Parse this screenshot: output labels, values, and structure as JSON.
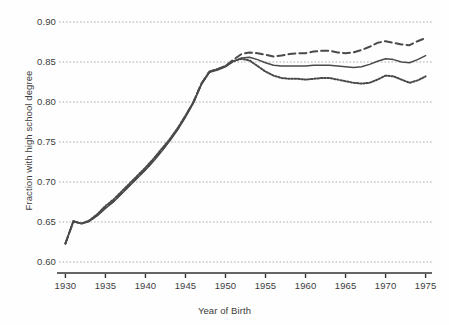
{
  "chart_data": {
    "type": "line",
    "title": "",
    "xlabel": "Year of Birth",
    "ylabel": "Fraction with high school degree",
    "xlim": [
      1929.2,
      1975.8
    ],
    "ylim": [
      0.6,
      0.9
    ],
    "xticks": [
      1930,
      1935,
      1940,
      1945,
      1950,
      1955,
      1960,
      1965,
      1970,
      1975
    ],
    "xtick_labels": [
      "1930",
      "1935",
      "1940",
      "1945",
      "1950",
      "1955",
      "1960",
      "1965",
      "1970",
      "1975"
    ],
    "yticks": [
      0.6,
      0.65,
      0.7,
      0.75,
      0.8,
      0.85,
      0.9
    ],
    "ytick_labels": [
      "0.60",
      "0.65",
      "0.70",
      "0.75",
      "0.80",
      "0.85",
      "0.90"
    ],
    "grid": true,
    "grid_style": "dotted",
    "grid_color": "#9a9a9a",
    "legend": "none",
    "line_color": "#4a4a4a",
    "x": [
      1930,
      1931,
      1932,
      1933,
      1934,
      1935,
      1936,
      1937,
      1938,
      1939,
      1940,
      1941,
      1942,
      1943,
      1944,
      1945,
      1946,
      1947,
      1948,
      1949,
      1950,
      1951,
      1952,
      1953,
      1954,
      1955,
      1956,
      1957,
      1958,
      1959,
      1960,
      1961,
      1962,
      1963,
      1964,
      1965,
      1966,
      1967,
      1968,
      1969,
      1970,
      1971,
      1972,
      1973,
      1974,
      1975
    ],
    "series": [
      {
        "name": "dashed",
        "style": "dashed",
        "values": [
          0.623,
          0.651,
          0.648,
          0.651,
          0.659,
          0.668,
          0.676,
          0.686,
          0.696,
          0.706,
          0.716,
          0.727,
          0.739,
          0.752,
          0.766,
          0.782,
          0.8,
          0.823,
          0.838,
          0.841,
          0.845,
          0.853,
          0.86,
          0.862,
          0.861,
          0.859,
          0.857,
          0.858,
          0.86,
          0.861,
          0.861,
          0.863,
          0.864,
          0.864,
          0.862,
          0.861,
          0.862,
          0.865,
          0.869,
          0.874,
          0.876,
          0.874,
          0.872,
          0.871,
          0.876,
          0.88
        ]
      },
      {
        "name": "solid",
        "style": "solid",
        "values": [
          0.623,
          0.651,
          0.648,
          0.651,
          0.658,
          0.667,
          0.675,
          0.685,
          0.695,
          0.705,
          0.715,
          0.726,
          0.738,
          0.751,
          0.765,
          0.781,
          0.799,
          0.822,
          0.837,
          0.84,
          0.844,
          0.851,
          0.855,
          0.856,
          0.853,
          0.849,
          0.846,
          0.845,
          0.845,
          0.845,
          0.845,
          0.846,
          0.846,
          0.846,
          0.845,
          0.844,
          0.843,
          0.844,
          0.847,
          0.851,
          0.854,
          0.853,
          0.85,
          0.849,
          0.853,
          0.858
        ]
      },
      {
        "name": "dotted",
        "style": "dotted",
        "values": [
          0.623,
          0.651,
          0.648,
          0.652,
          0.66,
          0.67,
          0.678,
          0.688,
          0.698,
          0.708,
          0.718,
          0.729,
          0.741,
          0.753,
          0.767,
          0.783,
          0.8,
          0.823,
          0.838,
          0.841,
          0.845,
          0.851,
          0.854,
          0.852,
          0.845,
          0.838,
          0.833,
          0.83,
          0.829,
          0.829,
          0.828,
          0.829,
          0.83,
          0.83,
          0.828,
          0.826,
          0.824,
          0.823,
          0.824,
          0.828,
          0.833,
          0.832,
          0.828,
          0.824,
          0.827,
          0.832
        ]
      }
    ]
  },
  "axis": {
    "ylabel": "Fraction with high school degree",
    "xlabel": "Year of Birth"
  }
}
